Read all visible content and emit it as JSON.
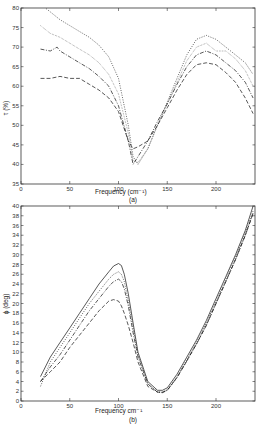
{
  "chart_data": [
    {
      "type": "line",
      "panel": "(a)",
      "title": "",
      "xlabel": "Frequency  (cm⁻¹)",
      "ylabel": "τ (%)",
      "xlim": [
        0,
        240
      ],
      "ylim": [
        35,
        80
      ],
      "xticks": [
        0,
        50,
        100,
        150,
        200
      ],
      "yticks": [
        35,
        40,
        45,
        50,
        55,
        60,
        65,
        70,
        75,
        80
      ],
      "grid": false,
      "legend": null,
      "series": [
        {
          "name": "dotted (upper)",
          "style": "dotted",
          "x": [
            20,
            30,
            40,
            50,
            60,
            70,
            80,
            90,
            100,
            110,
            115,
            120,
            130,
            140,
            150,
            160,
            170,
            180,
            190,
            200,
            210,
            220,
            230,
            238
          ],
          "y": [
            81,
            79,
            77,
            75.5,
            74,
            72.5,
            70.5,
            67.5,
            62,
            50,
            42,
            40,
            44,
            50,
            56,
            62,
            68,
            72,
            73,
            72,
            70,
            68,
            66,
            63
          ]
        },
        {
          "name": "dotted (second)",
          "style": "dotted-fine",
          "x": [
            20,
            30,
            40,
            50,
            60,
            70,
            80,
            90,
            100,
            110,
            115,
            120,
            130,
            140,
            150,
            160,
            170,
            180,
            190,
            200,
            210,
            220,
            230,
            238
          ],
          "y": [
            75.5,
            73.5,
            72.5,
            71,
            69.5,
            68,
            66,
            63,
            58,
            48,
            41,
            40.5,
            44,
            50,
            55.5,
            61,
            66.5,
            70,
            71,
            69,
            69,
            67,
            64,
            60
          ]
        },
        {
          "name": "dash-dot",
          "style": "dashdot",
          "x": [
            20,
            30,
            37,
            40,
            50,
            60,
            70,
            80,
            90,
            100,
            110,
            115,
            120,
            130,
            140,
            150,
            160,
            170,
            180,
            190,
            200,
            210,
            220,
            230,
            238
          ],
          "y": [
            69.5,
            69,
            70,
            69,
            67.5,
            66,
            64.5,
            62.5,
            60,
            55,
            46,
            40,
            42,
            46,
            51,
            55.5,
            60.5,
            65,
            68,
            69,
            68,
            66,
            64,
            61,
            57
          ]
        },
        {
          "name": "dashed (lower)",
          "style": "dashed",
          "x": [
            20,
            30,
            40,
            50,
            60,
            70,
            80,
            90,
            100,
            110,
            115,
            120,
            130,
            140,
            150,
            160,
            170,
            180,
            190,
            200,
            210,
            220,
            230,
            238
          ],
          "y": [
            62,
            62,
            62.5,
            62,
            62,
            60.5,
            59,
            57,
            53.5,
            46,
            44,
            44.5,
            46,
            50,
            54.5,
            59,
            63,
            65.5,
            66,
            65.5,
            63.5,
            61,
            57,
            53
          ]
        }
      ]
    },
    {
      "type": "line",
      "panel": "(b)",
      "title": "",
      "xlabel": "Frequency   cm⁻¹",
      "ylabel": "ϕ (deg)",
      "xlim": [
        0,
        240
      ],
      "ylim": [
        0,
        40
      ],
      "xticks": [
        0,
        50,
        100,
        150,
        200
      ],
      "yticks": [
        0,
        2,
        4,
        6,
        8,
        10,
        12,
        14,
        16,
        18,
        20,
        22,
        24,
        26,
        28,
        30,
        32,
        34,
        36,
        38,
        40
      ],
      "grid": false,
      "legend": null,
      "series": [
        {
          "name": "solid (upper)",
          "style": "solid",
          "x": [
            20,
            30,
            40,
            50,
            60,
            70,
            80,
            90,
            95,
            100,
            103,
            106,
            110,
            115,
            120,
            130,
            140,
            145,
            150,
            160,
            170,
            180,
            190,
            200,
            210,
            220,
            230,
            238
          ],
          "y": [
            5,
            9,
            12,
            15,
            18,
            21,
            24,
            26.5,
            27.7,
            28.2,
            27.8,
            26,
            22,
            16,
            10,
            4,
            2.2,
            2.2,
            2.7,
            5.5,
            9,
            12.5,
            16.5,
            21,
            25.5,
            30,
            35,
            40
          ]
        },
        {
          "name": "dotted",
          "style": "dotted",
          "x": [
            20,
            30,
            40,
            50,
            60,
            70,
            80,
            90,
            95,
            100,
            103,
            106,
            110,
            115,
            120,
            130,
            140,
            145,
            150,
            160,
            170,
            180,
            190,
            200,
            210,
            220,
            230,
            238
          ],
          "y": [
            3,
            8,
            11,
            14,
            17,
            20,
            22.5,
            25,
            26,
            26.5,
            26,
            24.5,
            20.5,
            15,
            9.5,
            3.5,
            1.9,
            1.8,
            2.3,
            5,
            8.5,
            12,
            16,
            20.5,
            25,
            29.5,
            34.5,
            39
          ]
        },
        {
          "name": "dash-dot",
          "style": "dashdot",
          "x": [
            20,
            30,
            40,
            50,
            60,
            70,
            80,
            90,
            95,
            100,
            103,
            106,
            110,
            115,
            120,
            130,
            140,
            145,
            150,
            160,
            170,
            180,
            190,
            200,
            210,
            220,
            230,
            238
          ],
          "y": [
            4,
            7,
            9.5,
            12.5,
            15.5,
            18.5,
            21,
            23.5,
            24.5,
            25,
            24.5,
            23,
            19.5,
            14,
            9,
            3.5,
            1.8,
            1.7,
            2.2,
            4.8,
            8.2,
            11.7,
            15.5,
            20,
            24.5,
            29,
            34,
            38.5
          ]
        },
        {
          "name": "dashed (lower)",
          "style": "dashed",
          "x": [
            20,
            30,
            40,
            50,
            60,
            70,
            80,
            90,
            95,
            100,
            103,
            106,
            110,
            115,
            120,
            130,
            140,
            145,
            150,
            160,
            170,
            180,
            190,
            200,
            210,
            220,
            230,
            238
          ],
          "y": [
            4,
            6,
            8,
            11,
            13.5,
            16,
            18.5,
            20.5,
            20.8,
            20.5,
            19.5,
            18,
            15.5,
            12,
            8,
            3,
            1.8,
            1.8,
            2.2,
            4.8,
            8.2,
            11.7,
            15.5,
            20,
            24.5,
            29,
            34,
            38.5
          ]
        }
      ]
    }
  ],
  "panels": {
    "a": {
      "caption": "(a)",
      "xlabel": "Frequency  (cm⁻¹)",
      "ylabel": "τ (%)"
    },
    "b": {
      "caption": "(b)",
      "xlabel": "Frequency   cm⁻¹",
      "ylabel": "ϕ (deg)"
    }
  }
}
